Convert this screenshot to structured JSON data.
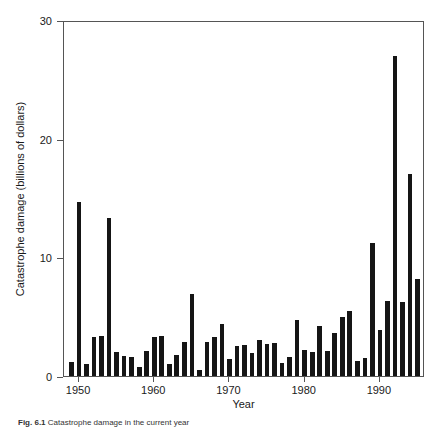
{
  "figure": {
    "caption_label": "Fig. 6.1",
    "caption_text": "Catastrophe damage in the current year",
    "background_color": "#ffffff",
    "bar_color": "#151515",
    "axis_color": "#555555"
  },
  "chart_data": {
    "type": "bar",
    "title": "",
    "subtitle": "",
    "xlabel": "Year",
    "ylabel": "Catastrophe damage (billions of dollars)",
    "xlim": [
      1948,
      1996
    ],
    "ylim": [
      0,
      30
    ],
    "yticks": [
      0,
      10,
      20,
      30
    ],
    "xticks": [
      1950,
      1960,
      1970,
      1980,
      1990
    ],
    "grid": false,
    "legend": null,
    "legend_position": "none",
    "categories": [
      1949,
      1950,
      1951,
      1952,
      1953,
      1954,
      1955,
      1956,
      1957,
      1958,
      1959,
      1960,
      1961,
      1962,
      1963,
      1964,
      1965,
      1966,
      1967,
      1968,
      1969,
      1970,
      1971,
      1972,
      1973,
      1974,
      1975,
      1976,
      1977,
      1978,
      1979,
      1980,
      1981,
      1982,
      1983,
      1984,
      1985,
      1986,
      1987,
      1988,
      1989,
      1990,
      1991,
      1992,
      1993,
      1994,
      1995
    ],
    "values": [
      1.2,
      14.7,
      1.0,
      3.3,
      3.4,
      13.3,
      2.0,
      1.7,
      1.6,
      0.8,
      2.1,
      3.3,
      3.4,
      1.0,
      1.8,
      2.9,
      6.9,
      0.5,
      2.9,
      3.3,
      4.4,
      1.4,
      2.5,
      2.6,
      1.9,
      3.0,
      2.7,
      2.8,
      1.1,
      1.6,
      4.7,
      2.2,
      2.0,
      4.2,
      2.1,
      3.6,
      5.0,
      5.5,
      1.3,
      1.5,
      11.2,
      3.9,
      6.3,
      27.0,
      6.2,
      17.0,
      8.2
    ]
  }
}
